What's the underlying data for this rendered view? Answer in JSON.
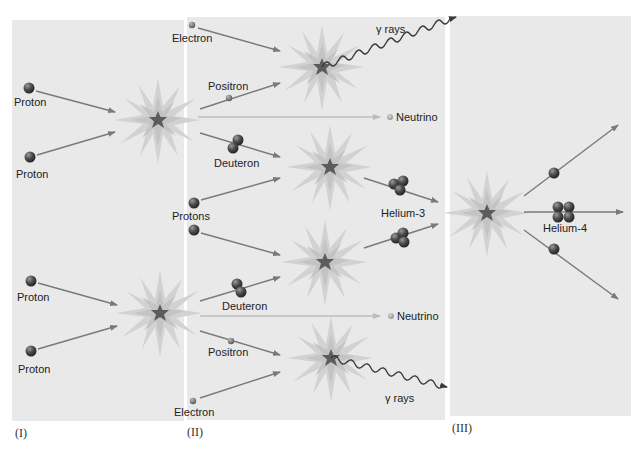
{
  "figure": {
    "stages": [
      {
        "id": "I",
        "label": "(I)"
      },
      {
        "id": "II",
        "label": "(II)"
      },
      {
        "id": "III",
        "label": "(III)"
      }
    ],
    "colors": {
      "panel_bg": "#e9e9e9",
      "page_bg": "#ffffff",
      "arrow": "#7a7a7a",
      "particle_dark": "#3c3c3c",
      "flash_outer": "#cfcfcf",
      "flash_core": "#5a5a5a"
    }
  },
  "labels": {
    "stage1": {
      "proton_top_1": "Proton",
      "proton_top_2": "Proton",
      "proton_bottom_1": "Proton",
      "proton_bottom_2": "Proton"
    },
    "stage2": {
      "electron_top": "Electron",
      "positron_top": "Positron",
      "gamma_top": "γ rays",
      "neutrino_top": "Neutrino",
      "deuteron_top": "Deuteron",
      "protons": "Protons",
      "helium3": "Helium-3",
      "deuteron_bottom": "Deuteron",
      "neutrino_bottom": "Neutrino",
      "positron_bottom": "Positron",
      "electron_bottom": "Electron",
      "gamma_bottom": "γ rays"
    },
    "stage3": {
      "helium4": "Helium-4"
    }
  }
}
